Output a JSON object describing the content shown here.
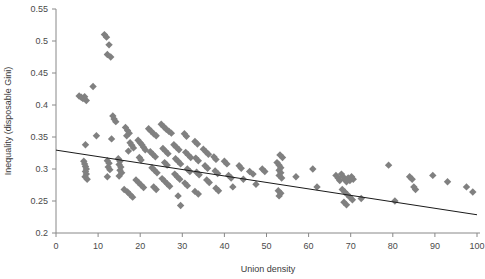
{
  "chart_data": {
    "type": "scatter",
    "title": "",
    "xlabel": "Union density",
    "ylabel": "Inequality (disposable Gini)",
    "xlim": [
      0,
      100
    ],
    "ylim": [
      0.2,
      0.55
    ],
    "xticks": [
      0,
      10,
      20,
      30,
      40,
      50,
      60,
      70,
      80,
      90,
      100
    ],
    "xtick_labels": [
      "0",
      "10",
      "20",
      "30",
      "40",
      "50",
      "60",
      "70",
      "80",
      "90",
      "100"
    ],
    "yticks": [
      0.2,
      0.25,
      0.3,
      0.35,
      0.4,
      0.45,
      0.5,
      0.55
    ],
    "ytick_labels": [
      "0.2",
      "0.25",
      "0.3",
      "0.35",
      "0.4",
      "0.45",
      "0.5",
      "0.55"
    ],
    "grid": false,
    "legend": null,
    "marker": {
      "shape": "diamond",
      "color": "#808080",
      "size": 5
    },
    "trendline": {
      "type": "linear",
      "color": "#1a1a1a",
      "x_start": 0,
      "y_start": 0.3295,
      "x_end": 100,
      "y_end": 0.2285
    },
    "points": [
      [
        5.5,
        0.414
      ],
      [
        6.0,
        0.412
      ],
      [
        6.4,
        0.41
      ],
      [
        6.8,
        0.413
      ],
      [
        7.2,
        0.407
      ],
      [
        8.8,
        0.429
      ],
      [
        7.0,
        0.338
      ],
      [
        6.6,
        0.312
      ],
      [
        6.8,
        0.308
      ],
      [
        7.0,
        0.304
      ],
      [
        7.2,
        0.3
      ],
      [
        7.0,
        0.296
      ],
      [
        7.2,
        0.292
      ],
      [
        6.9,
        0.288
      ],
      [
        7.4,
        0.284
      ],
      [
        9.6,
        0.352
      ],
      [
        11.5,
        0.51
      ],
      [
        12.0,
        0.506
      ],
      [
        12.6,
        0.494
      ],
      [
        12.2,
        0.479
      ],
      [
        13.0,
        0.475
      ],
      [
        13.5,
        0.383
      ],
      [
        13.8,
        0.378
      ],
      [
        14.2,
        0.374
      ],
      [
        13.2,
        0.347
      ],
      [
        12.2,
        0.313
      ],
      [
        12.6,
        0.309
      ],
      [
        12.4,
        0.303
      ],
      [
        12.8,
        0.299
      ],
      [
        12.2,
        0.288
      ],
      [
        14.8,
        0.316
      ],
      [
        15.2,
        0.312
      ],
      [
        15.0,
        0.307
      ],
      [
        15.4,
        0.303
      ],
      [
        15.2,
        0.298
      ],
      [
        15.6,
        0.294
      ],
      [
        15.0,
        0.289
      ],
      [
        16.5,
        0.365
      ],
      [
        17.0,
        0.36
      ],
      [
        17.4,
        0.356
      ],
      [
        16.8,
        0.352
      ],
      [
        17.6,
        0.341
      ],
      [
        18.0,
        0.337
      ],
      [
        18.4,
        0.333
      ],
      [
        17.2,
        0.328
      ],
      [
        16.2,
        0.268
      ],
      [
        17.0,
        0.264
      ],
      [
        17.6,
        0.26
      ],
      [
        18.2,
        0.256
      ],
      [
        19.5,
        0.345
      ],
      [
        20.0,
        0.341
      ],
      [
        20.4,
        0.338
      ],
      [
        20.8,
        0.334
      ],
      [
        21.2,
        0.33
      ],
      [
        19.8,
        0.318
      ],
      [
        20.2,
        0.314
      ],
      [
        19.0,
        0.283
      ],
      [
        19.6,
        0.279
      ],
      [
        20.2,
        0.275
      ],
      [
        20.8,
        0.271
      ],
      [
        22.0,
        0.363
      ],
      [
        22.6,
        0.359
      ],
      [
        23.2,
        0.355
      ],
      [
        23.8,
        0.352
      ],
      [
        22.4,
        0.327
      ],
      [
        23.0,
        0.323
      ],
      [
        23.6,
        0.319
      ],
      [
        22.8,
        0.302
      ],
      [
        23.4,
        0.298
      ],
      [
        24.0,
        0.294
      ],
      [
        23.2,
        0.272
      ],
      [
        23.8,
        0.268
      ],
      [
        25.0,
        0.37
      ],
      [
        25.6,
        0.366
      ],
      [
        26.2,
        0.362
      ],
      [
        26.8,
        0.359
      ],
      [
        27.4,
        0.356
      ],
      [
        25.4,
        0.332
      ],
      [
        26.0,
        0.328
      ],
      [
        26.6,
        0.324
      ],
      [
        25.8,
        0.31
      ],
      [
        26.4,
        0.306
      ],
      [
        25.2,
        0.285
      ],
      [
        25.8,
        0.281
      ],
      [
        26.4,
        0.277
      ],
      [
        27.0,
        0.273
      ],
      [
        28.0,
        0.338
      ],
      [
        28.6,
        0.334
      ],
      [
        29.2,
        0.33
      ],
      [
        28.4,
        0.316
      ],
      [
        29.0,
        0.312
      ],
      [
        29.6,
        0.308
      ],
      [
        28.2,
        0.292
      ],
      [
        28.8,
        0.288
      ],
      [
        29.4,
        0.284
      ],
      [
        29.0,
        0.258
      ],
      [
        29.6,
        0.243
      ],
      [
        30.5,
        0.355
      ],
      [
        31.0,
        0.351
      ],
      [
        30.8,
        0.326
      ],
      [
        31.4,
        0.322
      ],
      [
        32.0,
        0.318
      ],
      [
        31.2,
        0.3
      ],
      [
        31.8,
        0.296
      ],
      [
        30.6,
        0.278
      ],
      [
        31.2,
        0.274
      ],
      [
        33.0,
        0.343
      ],
      [
        33.6,
        0.339
      ],
      [
        33.2,
        0.317
      ],
      [
        33.8,
        0.313
      ],
      [
        33.4,
        0.295
      ],
      [
        34.0,
        0.291
      ],
      [
        33.0,
        0.265
      ],
      [
        33.8,
        0.261
      ],
      [
        35.0,
        0.331
      ],
      [
        35.6,
        0.327
      ],
      [
        36.2,
        0.323
      ],
      [
        35.4,
        0.305
      ],
      [
        36.0,
        0.301
      ],
      [
        35.8,
        0.283
      ],
      [
        36.4,
        0.279
      ],
      [
        37.5,
        0.319
      ],
      [
        38.0,
        0.315
      ],
      [
        37.8,
        0.297
      ],
      [
        38.4,
        0.293
      ],
      [
        38.0,
        0.27
      ],
      [
        38.6,
        0.266
      ],
      [
        40.0,
        0.312
      ],
      [
        40.6,
        0.308
      ],
      [
        41.0,
        0.29
      ],
      [
        41.6,
        0.286
      ],
      [
        42.0,
        0.272
      ],
      [
        43.5,
        0.305
      ],
      [
        44.0,
        0.301
      ],
      [
        44.5,
        0.284
      ],
      [
        46.0,
        0.296
      ],
      [
        46.8,
        0.292
      ],
      [
        47.5,
        0.276
      ],
      [
        52.5,
        0.31
      ],
      [
        53.0,
        0.306
      ],
      [
        53.4,
        0.302
      ],
      [
        53.0,
        0.298
      ],
      [
        53.4,
        0.294
      ],
      [
        53.0,
        0.29
      ],
      [
        53.6,
        0.286
      ],
      [
        53.2,
        0.322
      ],
      [
        53.8,
        0.318
      ],
      [
        52.8,
        0.266
      ],
      [
        53.4,
        0.262
      ],
      [
        53.0,
        0.258
      ],
      [
        49.0,
        0.3
      ],
      [
        49.6,
        0.296
      ],
      [
        57.0,
        0.288
      ],
      [
        61.0,
        0.3
      ],
      [
        62.0,
        0.272
      ],
      [
        66.5,
        0.29
      ],
      [
        67.0,
        0.286
      ],
      [
        67.4,
        0.282
      ],
      [
        67.8,
        0.292
      ],
      [
        68.2,
        0.288
      ],
      [
        68.6,
        0.284
      ],
      [
        69.0,
        0.28
      ],
      [
        69.4,
        0.286
      ],
      [
        69.8,
        0.282
      ],
      [
        70.2,
        0.288
      ],
      [
        70.6,
        0.284
      ],
      [
        68.0,
        0.268
      ],
      [
        68.6,
        0.264
      ],
      [
        69.2,
        0.26
      ],
      [
        69.8,
        0.256
      ],
      [
        70.4,
        0.252
      ],
      [
        68.4,
        0.248
      ],
      [
        69.0,
        0.244
      ],
      [
        72.5,
        0.254
      ],
      [
        79.0,
        0.306
      ],
      [
        80.5,
        0.25
      ],
      [
        84.0,
        0.288
      ],
      [
        84.6,
        0.284
      ],
      [
        85.0,
        0.272
      ],
      [
        85.4,
        0.268
      ],
      [
        89.5,
        0.29
      ],
      [
        93.0,
        0.28
      ],
      [
        97.5,
        0.272
      ],
      [
        99.0,
        0.264
      ]
    ]
  }
}
